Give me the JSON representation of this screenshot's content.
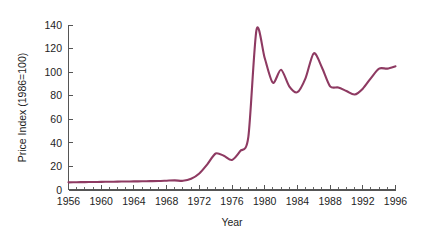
{
  "chart_data": {
    "type": "line",
    "title": "",
    "xlabel": "Year",
    "ylabel": "Price Index (1986=100)",
    "xlim": [
      1956,
      1996
    ],
    "ylim": [
      0,
      140
    ],
    "grid": false,
    "legend": null,
    "line_color": "#8E3A62",
    "axis_color": "#555555",
    "x_tick_labels": [
      "1956",
      "1960",
      "1964",
      "1968",
      "1972",
      "1976",
      "1980",
      "1984",
      "1988",
      "1992",
      "1996"
    ],
    "x_ticks": [
      1956,
      1960,
      1964,
      1968,
      1972,
      1976,
      1980,
      1984,
      1988,
      1992,
      1996
    ],
    "x_minor_tick_step": 1,
    "y_tick_labels": [
      "0",
      "20",
      "40",
      "60",
      "80",
      "100",
      "120",
      "140"
    ],
    "y_ticks": [
      0,
      20,
      40,
      60,
      80,
      100,
      120,
      140
    ],
    "series": [
      {
        "name": "Price Index",
        "x": [
          1956,
          1957,
          1958,
          1959,
          1960,
          1961,
          1962,
          1963,
          1964,
          1965,
          1966,
          1967,
          1968,
          1969,
          1970,
          1971,
          1972,
          1973,
          1974,
          1975,
          1976,
          1977,
          1978,
          1979,
          1980,
          1981,
          1982,
          1983,
          1984,
          1985,
          1986,
          1987,
          1988,
          1989,
          1990,
          1991,
          1992,
          1993,
          1994,
          1995,
          1996
        ],
        "values": [
          6.5,
          6.6,
          6.7,
          6.8,
          6.9,
          7.0,
          7.1,
          7.2,
          7.3,
          7.4,
          7.5,
          7.6,
          7.9,
          8.2,
          7.8,
          9.5,
          14.0,
          22.0,
          31.0,
          29.0,
          25.5,
          33.0,
          45.0,
          136.0,
          112.0,
          91.0,
          102.0,
          88.0,
          83.0,
          95.0,
          116.0,
          104.0,
          88.0,
          87.0,
          84.0,
          81.0,
          86.0,
          95.0,
          103.0,
          103.0,
          105.0
        ]
      }
    ]
  },
  "axis": {
    "y_title": "Price Index (1986=100)",
    "x_title": "Year"
  }
}
